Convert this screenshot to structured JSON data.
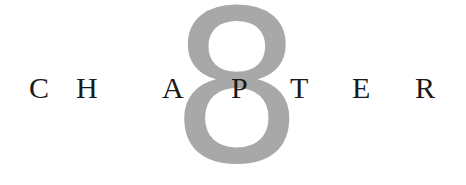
{
  "chapter": {
    "numeral": "8",
    "numeral_color": "#a8a8a8",
    "text_color": "#1a1a1a",
    "letters": [
      "C",
      "H",
      "A",
      "P",
      "T",
      "E",
      "R"
    ]
  }
}
